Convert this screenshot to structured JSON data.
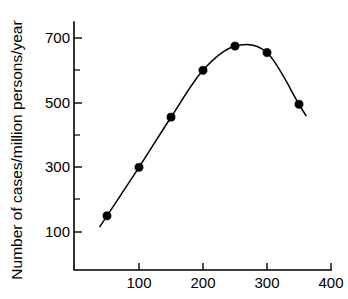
{
  "chart_data": {
    "type": "line",
    "title": "",
    "xlabel": "",
    "ylabel": "Number of cases/million persons/year",
    "x": [
      50,
      100,
      150,
      200,
      250,
      300,
      350
    ],
    "values": [
      150,
      300,
      455,
      600,
      675,
      655,
      495
    ],
    "series": [
      {
        "name": "Number of cases/million persons/year",
        "x": [
          50,
          100,
          150,
          200,
          250,
          300,
          350
        ],
        "values": [
          150,
          300,
          455,
          600,
          675,
          655,
          495
        ]
      }
    ],
    "xlim": [
      0,
      400
    ],
    "ylim": [
      0,
      780
    ],
    "xticks": [
      100,
      200,
      300,
      400
    ],
    "xtick_labels": [
      "100",
      "200",
      "300",
      "400"
    ],
    "yticks": [
      100,
      300,
      500,
      700
    ],
    "ytick_labels": [
      "100",
      "300",
      "500",
      "700"
    ],
    "yticks_minor": [
      200,
      400,
      600
    ],
    "grid": false,
    "legend": false,
    "legend_position": "none",
    "marker": "filled-circle",
    "line_color": "#000000",
    "marker_color": "#000000",
    "background_color": "#ffffff",
    "curve_extends_beyond_endpoints": true,
    "annotations": []
  },
  "axes": {
    "y_title": "Number of cases/million persons/year",
    "x_title": "",
    "y_tick_labels": [
      "700",
      "500",
      "300",
      "100"
    ],
    "x_tick_labels": [
      "100",
      "200",
      "300",
      "400"
    ]
  }
}
